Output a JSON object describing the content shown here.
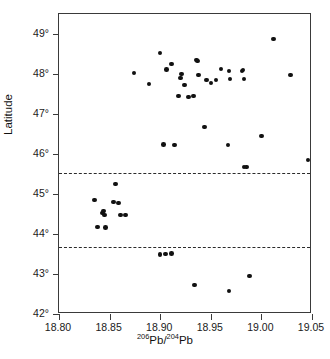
{
  "chart_data": {
    "type": "scatter",
    "title": "",
    "xlabel": "206Pb/204Pb",
    "xlabel_parts": {
      "sup1": "206",
      "base1": "Pb/",
      "sup2": "204",
      "base2": "Pb"
    },
    "ylabel": "Latitude",
    "xlim": [
      18.8,
      19.05
    ],
    "ylim": [
      42,
      49.5
    ],
    "xticks": [
      18.8,
      18.85,
      18.9,
      18.95,
      19.0,
      19.05
    ],
    "xtick_labels": [
      "18.80",
      "18.85",
      "18.90",
      "18.95",
      "19.00",
      "19.05"
    ],
    "yticks": [
      42,
      43,
      44,
      45,
      46,
      47,
      48,
      49
    ],
    "ytick_labels": [
      "42°",
      "43°",
      "44°",
      "45°",
      "46°",
      "47°",
      "48°",
      "49°"
    ],
    "grid": false,
    "legend": null,
    "marker": {
      "shape": "circle",
      "color": "#111111",
      "size": 4.6
    },
    "reference_lines": [
      {
        "name": "upper-boundary",
        "orientation": "horizontal",
        "y": 45.52,
        "style": "dashed",
        "color": "#2b2b2b"
      },
      {
        "name": "lower-boundary",
        "orientation": "horizontal",
        "y": 43.67,
        "style": "dashed",
        "color": "#2b2b2b"
      }
    ],
    "series": [
      {
        "name": "samples",
        "x": [
          18.874,
          18.889,
          18.9,
          18.906,
          18.911,
          18.918,
          18.92,
          18.921,
          18.924,
          18.928,
          18.933,
          18.936,
          18.937,
          18.938,
          18.946,
          18.95,
          18.955,
          18.96,
          18.968,
          18.969,
          18.981,
          18.982,
          18.983,
          18.985,
          19.012,
          19.029,
          19.051,
          18.903,
          18.914,
          18.944,
          18.967,
          19.0,
          18.983,
          19.046,
          18.835,
          18.838,
          18.843,
          18.844,
          18.845,
          18.846,
          18.854,
          18.856,
          18.859,
          18.861,
          18.866,
          18.9,
          18.905,
          18.911,
          18.934,
          18.968,
          18.988
        ],
        "y": [
          48.03,
          47.75,
          48.52,
          48.11,
          48.25,
          47.45,
          47.9,
          48.0,
          47.72,
          47.43,
          47.45,
          48.35,
          48.33,
          47.97,
          47.85,
          47.77,
          47.85,
          48.12,
          48.07,
          47.88,
          48.08,
          48.1,
          47.87,
          45.68,
          48.87,
          47.97,
          48.05,
          46.24,
          46.23,
          46.67,
          46.23,
          46.45,
          45.68,
          45.85,
          44.85,
          44.17,
          44.52,
          44.57,
          44.48,
          44.16,
          44.8,
          45.25,
          44.78,
          44.47,
          44.48,
          43.49,
          43.5,
          43.51,
          42.73,
          42.58,
          42.95
        ]
      }
    ]
  },
  "axes": {
    "ylabel_text": "Latitude"
  }
}
